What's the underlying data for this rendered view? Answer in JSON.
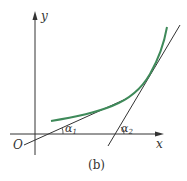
{
  "diagram": {
    "caption": "(b)",
    "origin_label": "O",
    "x_axis_label": "x",
    "y_axis_label": "y",
    "angles": [
      {
        "symbol": "α",
        "subscript": "1"
      },
      {
        "symbol": "α",
        "subscript": "2"
      }
    ],
    "elements": {
      "curve": "increasing convex curve",
      "tangent_line_1": "tangent at lower point, angle α1 with x-axis",
      "tangent_line_2": "tangent at upper point, angle α2 with x-axis"
    },
    "colors": {
      "curve": "#3f8a5a",
      "axes": "#333333",
      "lines": "#333333"
    }
  }
}
